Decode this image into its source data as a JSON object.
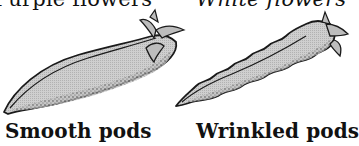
{
  "figure": {
    "top_labels": {
      "left": "Purple flowers",
      "right": "White flowers"
    },
    "pods": [
      {
        "id": "smooth",
        "label": "Smooth pods",
        "edge": "smooth"
      },
      {
        "id": "wrinkled",
        "label": "Wrinkled pods",
        "edge": "wavy"
      }
    ],
    "colors": {
      "pod_fill": "#c4c4c4",
      "outline": "#1a1a1a",
      "stipple": "#333333",
      "background": "#ffffff"
    }
  }
}
